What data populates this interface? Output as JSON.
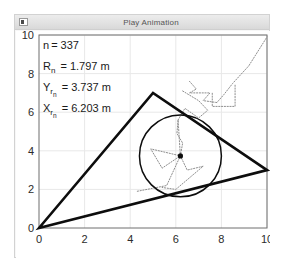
{
  "window": {
    "title": "Play Animation",
    "icon": "window-app-icon"
  },
  "chart_data": {
    "type": "scatter",
    "title": "",
    "xlabel": "",
    "ylabel": "",
    "xlim": [
      0,
      10
    ],
    "ylim": [
      0,
      10
    ],
    "xticks": [
      "0",
      "2",
      "4",
      "6",
      "8",
      "10"
    ],
    "yticks": [
      "0",
      "2",
      "4",
      "6",
      "8",
      "10"
    ],
    "xtick_values": [
      0,
      2,
      4,
      6,
      8,
      10
    ],
    "ytick_values": [
      0,
      2,
      4,
      6,
      8,
      10
    ],
    "grid": true,
    "legend": "none",
    "annotations": [
      {
        "label": "n",
        "sub": "",
        "sub2": "",
        "eq": "=",
        "value": "337",
        "unit": ""
      },
      {
        "label": "R",
        "sub": "n",
        "sub2": "",
        "eq": "=",
        "value": "1.797",
        "unit": "m"
      },
      {
        "label": "Y",
        "sub": "r",
        "sub2": "n",
        "eq": "=",
        "value": "3.737",
        "unit": "m"
      },
      {
        "label": "X",
        "sub": "r",
        "sub2": "n",
        "eq": "=",
        "value": "6.203",
        "unit": "m"
      }
    ],
    "series": [
      {
        "name": "triangle",
        "type": "polygon",
        "closed": true,
        "points": [
          [
            0,
            0
          ],
          [
            5,
            7
          ],
          [
            10,
            3
          ]
        ],
        "color": "#0d0d0d"
      },
      {
        "name": "circle",
        "type": "circle",
        "center": [
          6.203,
          3.737
        ],
        "radius": 1.797,
        "color": "#0d0d0d"
      },
      {
        "name": "center-marker",
        "type": "point",
        "points": [
          [
            6.203,
            3.737
          ]
        ],
        "color": "#0d0d0d"
      },
      {
        "name": "trail-upper-right",
        "type": "dotted-path",
        "points": [
          [
            6.6,
            7.6
          ],
          [
            6.9,
            7.2
          ],
          [
            6.6,
            7.0
          ],
          [
            7.5,
            7.0
          ],
          [
            7.2,
            6.6
          ],
          [
            7.8,
            6.5
          ],
          [
            8.1,
            6.9
          ],
          [
            8.5,
            7.5
          ],
          [
            9.2,
            8.4
          ],
          [
            10.0,
            9.9
          ]
        ],
        "color": "#8e8e8e"
      },
      {
        "name": "trail-box-right",
        "type": "dotted-path",
        "points": [
          [
            8.6,
            7.4
          ],
          [
            8.6,
            6.3
          ],
          [
            7.6,
            6.3
          ],
          [
            7.6,
            7.0
          ]
        ],
        "color": "#8e8e8e"
      },
      {
        "name": "trail-mid",
        "type": "dotted-path",
        "points": [
          [
            6.3,
            7.1
          ],
          [
            7.0,
            6.6
          ],
          [
            7.4,
            6.1
          ],
          [
            7.0,
            5.7
          ],
          [
            6.4,
            6.2
          ],
          [
            6.1,
            5.6
          ]
        ],
        "color": "#8e8e8e"
      },
      {
        "name": "trail-inner-spokes",
        "type": "dotted-path",
        "points": [
          [
            6.2,
            3.74
          ],
          [
            6.1,
            5.6
          ],
          [
            6.05,
            4.9
          ],
          [
            6.3,
            4.4
          ],
          [
            6.2,
            3.74
          ],
          [
            4.9,
            4.1
          ],
          [
            5.4,
            3.1
          ],
          [
            6.2,
            3.74
          ],
          [
            5.6,
            2.2
          ],
          [
            4.3,
            1.9
          ]
        ],
        "color": "#8e8e8e"
      },
      {
        "name": "trail-lower",
        "type": "dotted-path",
        "points": [
          [
            6.2,
            3.74
          ],
          [
            6.5,
            3.0
          ],
          [
            7.2,
            3.2
          ],
          [
            6.6,
            2.6
          ],
          [
            6.0,
            2.0
          ],
          [
            5.4,
            2.1
          ]
        ],
        "color": "#8e8e8e"
      }
    ]
  }
}
